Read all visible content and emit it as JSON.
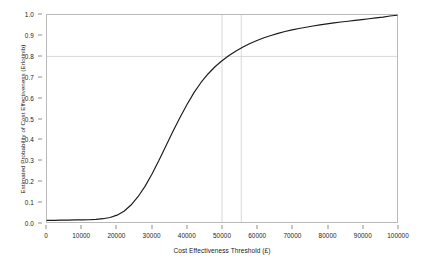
{
  "chart_data": {
    "type": "line",
    "title": "",
    "xlabel": "Cost Effectiveness Threshold (£)",
    "ylabel": "Estimated Probability of Cost Effectiveness (Erlotinib)",
    "xlim": [
      0,
      100000
    ],
    "ylim": [
      0.0,
      1.0
    ],
    "grid": true,
    "legend": "none",
    "line_color": "#1a1a1a",
    "grid_color": "#d8d8d8",
    "axis_color": "#b9b9b9",
    "background": "#ffffff",
    "xticks": [
      0,
      10000,
      20000,
      30000,
      40000,
      50000,
      60000,
      70000,
      80000,
      90000,
      100000
    ],
    "xtick_labels": [
      "0",
      "10000",
      "20000",
      "30000",
      "40000",
      "50000",
      "60000",
      "70000",
      "80000",
      "90000",
      "100000"
    ],
    "yticks": [
      0.0,
      0.1,
      0.2,
      0.3,
      0.4,
      0.5,
      0.6,
      0.7,
      0.8,
      0.9,
      1.0
    ],
    "ytick_labels": [
      "0.0",
      "0.1",
      "0.2",
      "0.3",
      "0.4",
      "0.5",
      "0.6",
      "0.7",
      "0.8",
      "0.9",
      "1.0"
    ],
    "gridlines": {
      "horizontal": [
        0.8
      ],
      "vertical": [
        50000,
        55500
      ]
    },
    "series": [
      {
        "name": "Estimated Probability of Cost Effectiveness (Erlotinib)",
        "x": [
          0,
          2000,
          4000,
          6000,
          8000,
          10000,
          12000,
          14000,
          16000,
          18000,
          20000,
          22000,
          24000,
          26000,
          28000,
          30000,
          32000,
          34000,
          36000,
          38000,
          40000,
          42000,
          44000,
          46000,
          48000,
          50000,
          52000,
          54000,
          56000,
          58000,
          60000,
          62000,
          64000,
          66000,
          68000,
          70000,
          72000,
          74000,
          76000,
          78000,
          80000,
          82000,
          84000,
          86000,
          88000,
          90000,
          92000,
          94000,
          96000,
          98000,
          100000
        ],
        "y": [
          0.008,
          0.008,
          0.009,
          0.009,
          0.01,
          0.01,
          0.011,
          0.013,
          0.016,
          0.022,
          0.033,
          0.052,
          0.082,
          0.122,
          0.172,
          0.232,
          0.298,
          0.368,
          0.438,
          0.505,
          0.568,
          0.625,
          0.674,
          0.715,
          0.75,
          0.779,
          0.804,
          0.826,
          0.845,
          0.862,
          0.877,
          0.89,
          0.901,
          0.911,
          0.92,
          0.928,
          0.935,
          0.941,
          0.947,
          0.952,
          0.957,
          0.962,
          0.966,
          0.97,
          0.974,
          0.978,
          0.982,
          0.986,
          0.99,
          0.995,
          0.999
        ]
      }
    ]
  }
}
